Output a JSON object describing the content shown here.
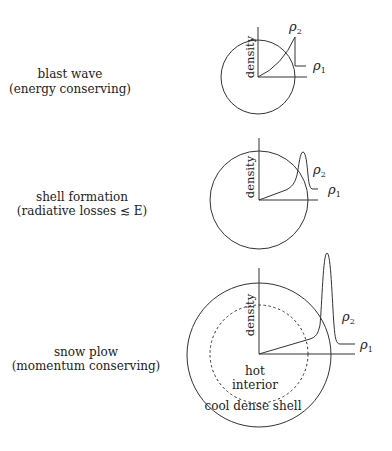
{
  "panels": [
    {
      "title": "blast wave",
      "subtitle": "(energy conserving)",
      "axis_label": "density",
      "rho_outer": "ρ",
      "rho_outer_sub": "1",
      "rho_shell": "ρ",
      "rho_shell_sub": "2"
    },
    {
      "title": "shell formation",
      "subtitle": "(radiative losses ≲ E)",
      "axis_label": "density",
      "rho_outer": "ρ",
      "rho_outer_sub": "1",
      "rho_shell": "ρ",
      "rho_shell_sub": "2"
    },
    {
      "title": "snow plow",
      "subtitle": "(momentum conserving)",
      "axis_label": "density",
      "rho_outer": "ρ",
      "rho_outer_sub": "1",
      "rho_shell": "ρ",
      "rho_shell_sub": "2",
      "inner_label_1": "hot",
      "inner_label_2": "interior",
      "shell_label": "cool dense shell"
    }
  ]
}
